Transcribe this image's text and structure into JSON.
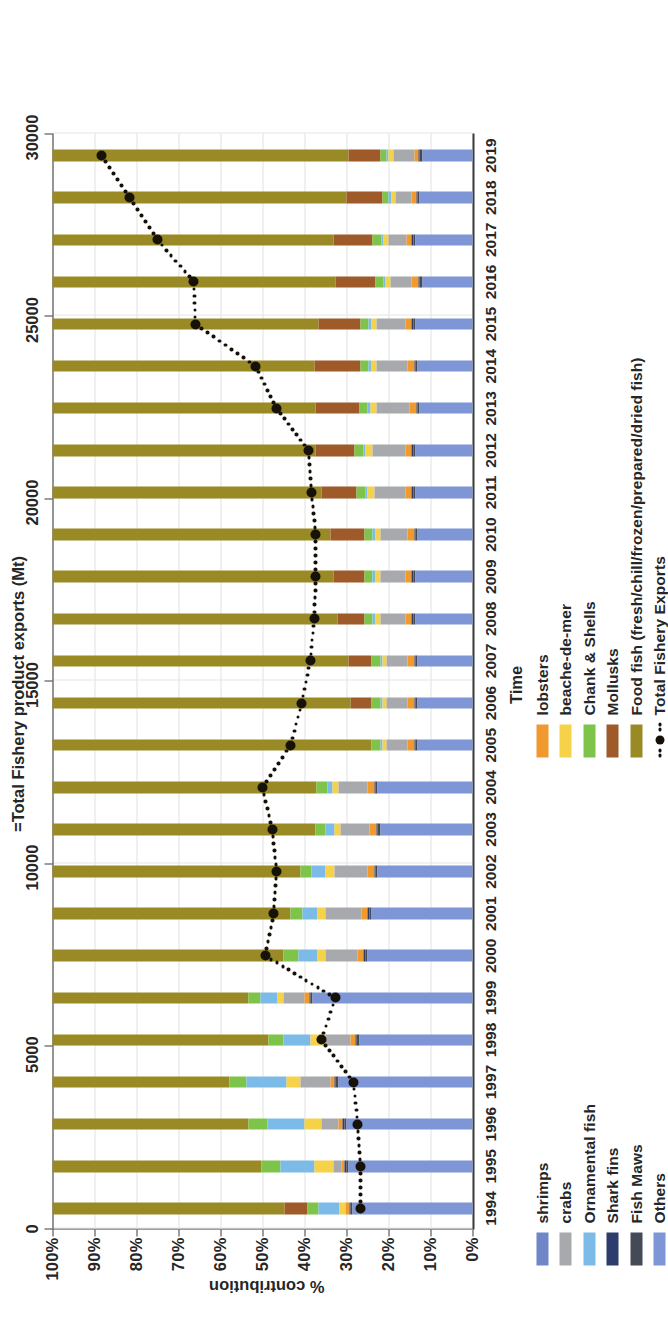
{
  "chart_data": {
    "type": "bar",
    "subtype": "stacked-bar-100pct-with-line",
    "title": "",
    "xlabel": "Time",
    "ylabel": "% contribution",
    "y2label": "=Total Fishery product exports (Mt)",
    "ylim": [
      0,
      100
    ],
    "y2lim": [
      0,
      30000
    ],
    "grid": true,
    "legend_position": "bottom",
    "ytick_labels": [
      "0%",
      "10%",
      "20%",
      "30%",
      "40%",
      "50%",
      "60%",
      "70%",
      "80%",
      "90%",
      "100%"
    ],
    "y2tick_labels": [
      "0",
      "5000",
      "10000",
      "15000",
      "20000",
      "25000",
      "30000"
    ],
    "categories": [
      1994,
      1995,
      1996,
      1997,
      1998,
      1999,
      2000,
      2001,
      2002,
      2003,
      2004,
      2005,
      2006,
      2007,
      2008,
      2009,
      2010,
      2011,
      2012,
      2013,
      2014,
      2015,
      2016,
      2017,
      2018,
      2019
    ],
    "series": [
      {
        "name": "Others",
        "color": "#7e96d6",
        "values": [
          28.5,
          29.5,
          30.0,
          32.0,
          27.0,
          38.0,
          25.0,
          24.0,
          22.5,
          22.0,
          22.5,
          13.0,
          13.0,
          13.0,
          13.5,
          13.5,
          13.0,
          13.5,
          13.5,
          12.5,
          13.0,
          13.5,
          12.0,
          13.5,
          12.5,
          12.0
        ]
      },
      {
        "name": "Fish Maws",
        "color": "#454a57",
        "values": [
          0.5,
          0.5,
          0.5,
          0.5,
          0.5,
          0.5,
          0.5,
          0.5,
          0.5,
          0.5,
          0.5,
          0.5,
          0.5,
          0.5,
          0.5,
          0.5,
          0.5,
          0.5,
          0.5,
          0.5,
          0.5,
          0.5,
          0.5,
          0.5,
          0.5,
          0.5
        ]
      },
      {
        "name": "Shark fins",
        "color": "#2d3c6b",
        "values": [
          0.4,
          0.4,
          0.4,
          0.4,
          0.4,
          0.4,
          0.4,
          0.4,
          0.4,
          0.4,
          0.4,
          0.4,
          0.4,
          0.4,
          0.4,
          0.4,
          0.4,
          0.4,
          0.4,
          0.4,
          0.4,
          0.4,
          0.4,
          0.4,
          0.4,
          0.4
        ]
      },
      {
        "name": "lobsters",
        "color": "#f0992f",
        "values": [
          0.8,
          0.8,
          1.0,
          1.0,
          1.2,
          1.0,
          1.5,
          1.5,
          1.5,
          1.5,
          1.5,
          1.5,
          1.5,
          1.5,
          1.5,
          1.5,
          1.5,
          1.5,
          1.5,
          1.5,
          1.5,
          1.5,
          1.5,
          1.2,
          1.0,
          1.0
        ]
      },
      {
        "name": "crabs",
        "color": "#a7a9ac",
        "values": [
          0.0,
          2.0,
          4.0,
          7.0,
          6.0,
          5.0,
          7.5,
          8.5,
          8.0,
          7.0,
          7.0,
          5.0,
          5.0,
          5.0,
          6.0,
          6.0,
          6.5,
          7.5,
          8.0,
          8.0,
          7.5,
          7.0,
          5.0,
          4.5,
          4.0,
          5.0
        ]
      },
      {
        "name": "beache-de-mer",
        "color": "#f6d24a",
        "values": [
          1.5,
          4.5,
          4.0,
          3.5,
          3.5,
          1.5,
          2.0,
          2.0,
          2.0,
          1.5,
          1.5,
          1.0,
          1.0,
          1.0,
          1.2,
          1.2,
          1.2,
          1.5,
          1.5,
          1.5,
          1.2,
          1.2,
          1.2,
          1.0,
          1.0,
          1.0
        ]
      },
      {
        "name": "Ornamental fish",
        "color": "#7cbbe8",
        "values": [
          5.0,
          8.0,
          9.0,
          9.5,
          6.5,
          4.0,
          4.5,
          3.5,
          3.5,
          2.0,
          1.2,
          0.6,
          0.6,
          0.6,
          0.6,
          0.6,
          0.6,
          0.6,
          0.6,
          0.6,
          0.6,
          0.6,
          0.6,
          0.6,
          0.6,
          0.6
        ]
      },
      {
        "name": "Chank & Shells",
        "color": "#7ec44a",
        "values": [
          2.5,
          4.5,
          4.5,
          4.0,
          3.5,
          3.0,
          3.5,
          3.0,
          2.5,
          2.5,
          2.5,
          2.0,
          2.0,
          2.0,
          2.0,
          2.0,
          2.0,
          2.0,
          2.0,
          2.0,
          2.0,
          2.0,
          2.0,
          2.0,
          1.5,
          1.5
        ]
      },
      {
        "name": "Mollusks",
        "color": "#9e5a28",
        "values": [
          5.5,
          0.0,
          0.0,
          0.0,
          0.0,
          0.0,
          0.0,
          0.0,
          0.0,
          0.0,
          0.0,
          0.0,
          5.0,
          5.5,
          6.5,
          7.5,
          8.0,
          8.5,
          9.5,
          10.5,
          11.0,
          10.0,
          9.5,
          9.5,
          8.5,
          7.5
        ]
      },
      {
        "name": "shrimps",
        "color": "#6f86c9",
        "values": [
          0.0,
          0.0,
          0.0,
          0.0,
          0.0,
          0.0,
          0.0,
          0.0,
          0.0,
          0.0,
          0.0,
          0.0,
          0.0,
          0.0,
          0.0,
          0.0,
          0.0,
          0.0,
          0.0,
          0.0,
          0.0,
          0.0,
          0.0,
          0.0,
          0.0,
          0.0
        ]
      },
      {
        "name": "Food fish (fresh/chill/frozen/prepared/dried fish)",
        "color": "#9a8a25",
        "values": [
          55.3,
          49.8,
          46.6,
          42.1,
          51.4,
          46.6,
          55.1,
          56.6,
          59.1,
          62.6,
          62.9,
          76.0,
          71.0,
          70.5,
          67.8,
          66.8,
          66.3,
          64.0,
          62.5,
          62.5,
          62.3,
          63.3,
          67.3,
          66.8,
          70.0,
          70.5
        ]
      }
    ],
    "line_series": {
      "name": "Total Fishery Exports",
      "style": "dotted",
      "marker": "circle",
      "color": "#141008",
      "values": [
        8000,
        8000,
        8200,
        8500,
        10800,
        9800,
        14800,
        14200,
        14000,
        14300,
        15000,
        13000,
        12200,
        11600,
        11300,
        11200,
        11200,
        11500,
        11700,
        14000,
        15500,
        19800,
        19900,
        22500,
        24500,
        26500
      ]
    }
  },
  "legend": {
    "column1": [
      {
        "label": "shrimps",
        "color": "#6f86c9"
      },
      {
        "label": "crabs",
        "color": "#a7a9ac"
      },
      {
        "label": "Ornamental fish",
        "color": "#7cbbe8"
      },
      {
        "label": "Shark fins",
        "color": "#2d3c6b"
      },
      {
        "label": "Fish Maws",
        "color": "#454a57"
      },
      {
        "label": "Others",
        "color": "#7e96d6"
      }
    ],
    "column2": [
      {
        "label": "lobsters",
        "color": "#f0992f"
      },
      {
        "label": "beache-de-mer",
        "color": "#f6d24a"
      },
      {
        "label": "Chank & Shells",
        "color": "#7ec44a"
      },
      {
        "label": "Mollusks",
        "color": "#9e5a28"
      },
      {
        "label": "Food fish (fresh/chill/frozen/prepared/dried fish)",
        "color": "#9a8a25"
      },
      {
        "label": "Total Fishery Exports",
        "color": "#141008"
      }
    ]
  }
}
